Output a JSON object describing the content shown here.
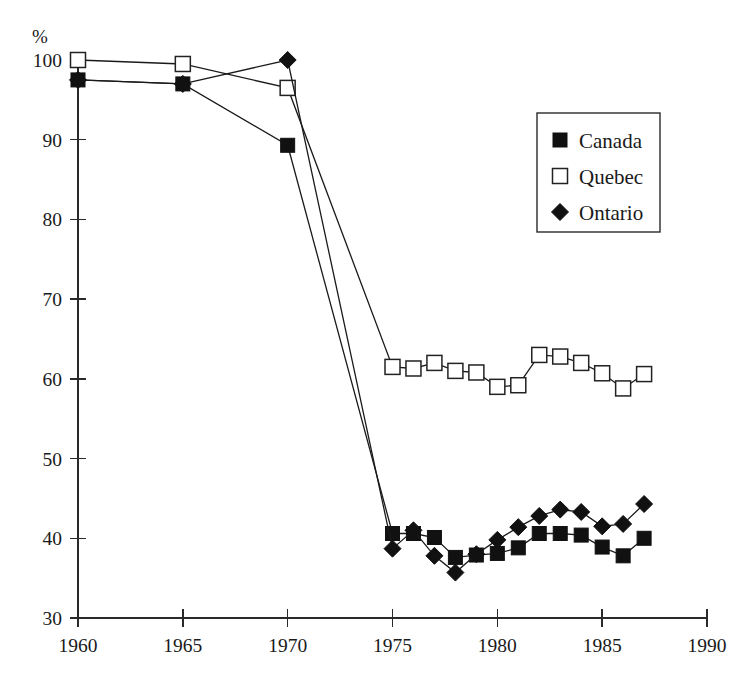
{
  "chart_data": {
    "type": "line",
    "title": "",
    "subtitle": "",
    "xlabel": "",
    "ylabel": "%",
    "xlim": [
      1960,
      1990
    ],
    "ylim": [
      30,
      100
    ],
    "xticks": [
      1960,
      1965,
      1970,
      1975,
      1980,
      1985,
      1990
    ],
    "yticks": [
      30,
      40,
      50,
      60,
      70,
      80,
      90,
      100
    ],
    "grid": false,
    "legend_position": "top-right",
    "legend_entries": [
      {
        "name": "Canada",
        "marker": "filled-square"
      },
      {
        "name": "Quebec",
        "marker": "open-square"
      },
      {
        "name": "Ontario",
        "marker": "filled-diamond"
      }
    ],
    "series": [
      {
        "name": "Canada",
        "marker": "filled-square",
        "x": [
          1960,
          1965,
          1970,
          1975,
          1976,
          1977,
          1978,
          1979,
          1980,
          1981,
          1982,
          1983,
          1984,
          1985,
          1986,
          1987
        ],
        "values": [
          97.5,
          97.0,
          89.3,
          40.6,
          40.6,
          40.1,
          37.6,
          37.9,
          38.1,
          38.8,
          40.6,
          40.6,
          40.4,
          38.9,
          37.8,
          40.0
        ]
      },
      {
        "name": "Quebec",
        "marker": "open-square",
        "x": [
          1960,
          1965,
          1970,
          1975,
          1976,
          1977,
          1978,
          1979,
          1980,
          1981,
          1982,
          1983,
          1984,
          1985,
          1986,
          1987
        ],
        "values": [
          100.0,
          99.5,
          96.5,
          61.5,
          61.3,
          62.0,
          61.0,
          60.8,
          59.0,
          59.2,
          63.0,
          62.8,
          62.0,
          60.7,
          58.8,
          60.6
        ]
      },
      {
        "name": "Ontario",
        "marker": "filled-diamond",
        "x": [
          1960,
          1965,
          1970,
          1975,
          1976,
          1977,
          1978,
          1979,
          1980,
          1981,
          1982,
          1983,
          1984,
          1985,
          1986,
          1987
        ],
        "values": [
          97.5,
          97.0,
          100.0,
          38.7,
          41.0,
          37.8,
          35.7,
          38.0,
          39.8,
          41.4,
          42.8,
          43.6,
          43.3,
          41.5,
          41.8,
          44.3
        ]
      }
    ],
    "colors": {
      "axis": "#2a2a2a",
      "line": "#1a1a1a",
      "canada": "#111111",
      "quebec": "#ffffff",
      "ontario": "#111111",
      "background": "#ffffff"
    }
  }
}
